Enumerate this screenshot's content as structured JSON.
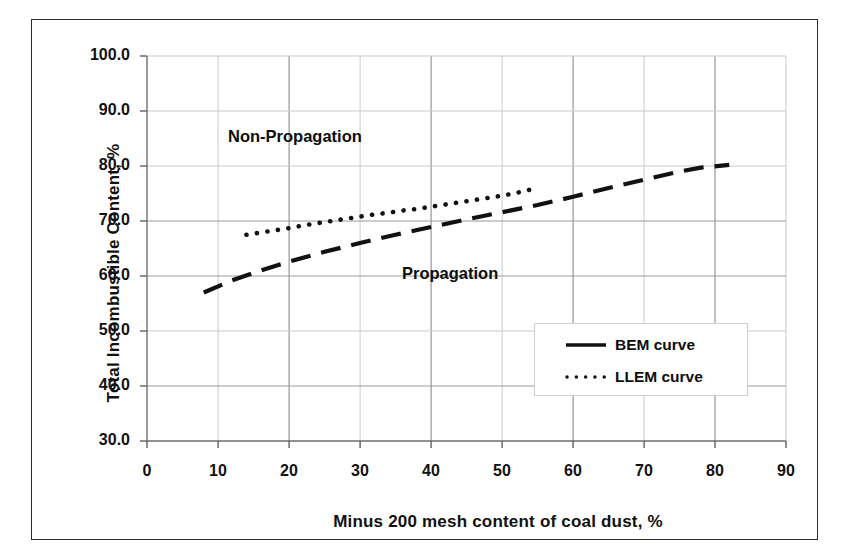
{
  "chart_data": {
    "type": "line",
    "title": "",
    "xlabel": "Minus 200 mesh content of coal dust, %",
    "ylabel": "Total Incombustible Content, %",
    "xlim": [
      0,
      90
    ],
    "ylim": [
      30,
      100
    ],
    "x_ticks": [
      "0",
      "10",
      "20",
      "30",
      "40",
      "50",
      "60",
      "70",
      "80",
      "90"
    ],
    "y_ticks": [
      "100.0",
      "90.0",
      "80.0",
      "70.0",
      "60.0",
      "50.0",
      "40.0",
      "30.0"
    ],
    "grid": true,
    "legend_position": "inside-lower-right",
    "series": [
      {
        "name": "BEM curve",
        "style": "dashed",
        "color": "#111111",
        "x": [
          8,
          12,
          16,
          20,
          25,
          30,
          35,
          40,
          45,
          50,
          55,
          60,
          65,
          70,
          75,
          78,
          82
        ],
        "y": [
          57.0,
          59.2,
          61.0,
          62.6,
          64.4,
          66.0,
          67.5,
          68.9,
          70.3,
          71.6,
          72.9,
          74.4,
          76.0,
          77.5,
          79.0,
          79.7,
          80.2
        ]
      },
      {
        "name": "LLEM curve",
        "style": "dotted",
        "color": "#111111",
        "x": [
          14,
          16,
          18,
          20,
          22,
          24,
          26,
          28,
          30,
          32,
          34,
          36,
          38,
          40,
          42,
          44,
          46,
          48,
          50,
          52,
          54,
          55
        ],
        "y": [
          67.5,
          67.9,
          68.3,
          68.7,
          69.2,
          69.6,
          70.0,
          70.4,
          70.8,
          71.2,
          71.5,
          71.9,
          72.2,
          72.6,
          73.0,
          73.4,
          73.8,
          74.2,
          74.6,
          75.1,
          75.7,
          76.2
        ]
      }
    ],
    "annotations": [
      {
        "text": "Non-Propagation",
        "x": 20,
        "y": 87
      },
      {
        "text": "Propagation",
        "x": 37,
        "y": 62
      }
    ],
    "legend": [
      {
        "label": "BEM curve",
        "style": "dashed"
      },
      {
        "label": "LLEM curve",
        "style": "dotted"
      }
    ]
  },
  "colors": {
    "frame": "#2b2b2b",
    "grid_major": "#8f8f8f",
    "grid_minor": "#cccccc",
    "axis": "#6e6e6e",
    "series": "#111111",
    "background": "#ffffff"
  }
}
